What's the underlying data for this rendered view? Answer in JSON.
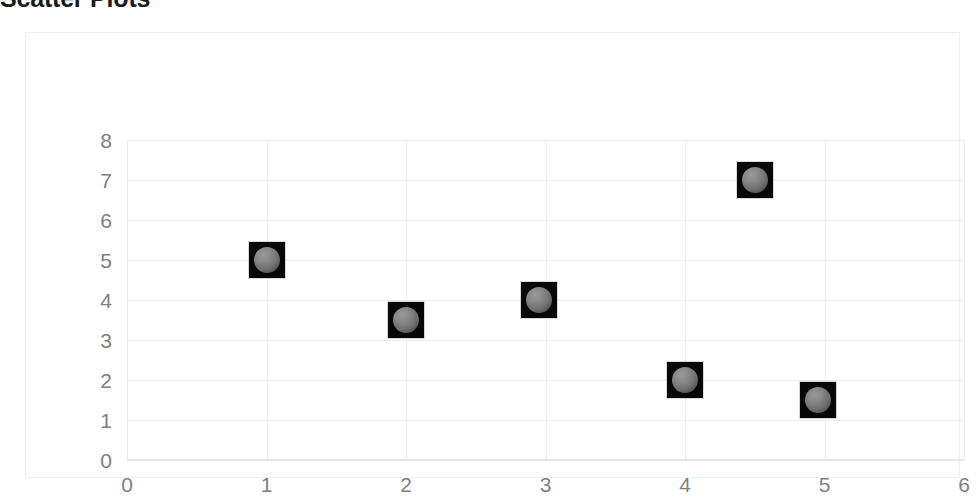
{
  "title": "Scatter Plots",
  "chart_data": {
    "type": "scatter",
    "title": "Scatter Plots",
    "xlabel": "",
    "ylabel": "",
    "xlim": [
      0,
      6
    ],
    "ylim": [
      0,
      8
    ],
    "xticks": [
      0,
      1,
      2,
      3,
      4,
      5,
      6
    ],
    "yticks": [
      0,
      1,
      2,
      3,
      4,
      5,
      6,
      7,
      8
    ],
    "xtick_labels": [
      "0",
      "1",
      "2",
      "3",
      "4",
      "5",
      "6"
    ],
    "ytick_labels": [
      "0",
      "1",
      "2",
      "3",
      "4",
      "5",
      "6",
      "7",
      "8"
    ],
    "grid": true,
    "legend": false,
    "marker_style": "dark-square-with-sphere",
    "series": [
      {
        "name": "Series 1",
        "points": [
          {
            "x": 1.0,
            "y": 5.0
          },
          {
            "x": 2.0,
            "y": 3.5
          },
          {
            "x": 2.95,
            "y": 4.0
          },
          {
            "x": 4.0,
            "y": 2.0
          },
          {
            "x": 4.5,
            "y": 7.0
          },
          {
            "x": 4.95,
            "y": 1.5
          }
        ]
      }
    ]
  },
  "colors": {
    "background": "#ffffff",
    "gridline": "#ededed",
    "frame_border": "#efeff1",
    "tick_label": "#7f7f7f",
    "marker_fill": "#080808",
    "marker_bead": "#858585",
    "title": "#1a1a1a"
  }
}
